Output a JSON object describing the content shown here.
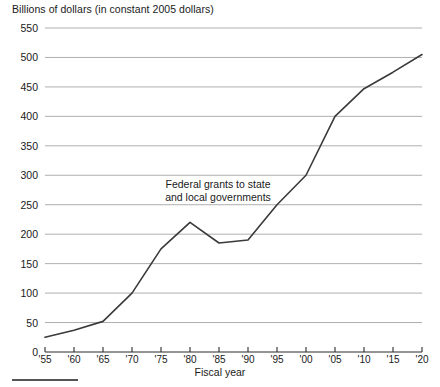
{
  "chart_data": {
    "type": "line",
    "title": "Billions of dollars (in constant 2005 dollars)",
    "xlabel": "Fiscal year",
    "ylabel": "",
    "xlim": [
      1955,
      2020
    ],
    "ylim": [
      0,
      550
    ],
    "grid": true,
    "legend": false,
    "annotations": [
      {
        "text_line1": "Federal grants to state",
        "text_line2": "and local governments",
        "x": 1981,
        "y": 255
      }
    ],
    "ytick_labels": [
      "0",
      "50",
      "100",
      "150",
      "200",
      "250",
      "300",
      "350",
      "400",
      "450",
      "500",
      "550"
    ],
    "ytick_values": [
      0,
      50,
      100,
      150,
      200,
      250,
      300,
      350,
      400,
      450,
      500,
      550
    ],
    "xtick_labels": [
      "'55",
      "'60",
      "'65",
      "'70",
      "'75",
      "'80",
      "'85",
      "'90",
      "'95",
      "'00",
      "'05",
      "'10",
      "'15",
      "'20"
    ],
    "xtick_values": [
      1955,
      1960,
      1965,
      1970,
      1975,
      1980,
      1985,
      1990,
      1995,
      2000,
      2005,
      2010,
      2015,
      2020
    ],
    "series": [
      {
        "name": "Federal grants to state and local governments",
        "color": "#3a3a3a",
        "x": [
          1955,
          1960,
          1965,
          1970,
          1975,
          1980,
          1985,
          1990,
          1995,
          2000,
          2005,
          2010,
          2015,
          2020
        ],
        "values": [
          25,
          37,
          52,
          100,
          175,
          220,
          185,
          190,
          250,
          300,
          400,
          447,
          475,
          505
        ]
      }
    ]
  },
  "footer": {
    "rule_color": "#555555"
  }
}
